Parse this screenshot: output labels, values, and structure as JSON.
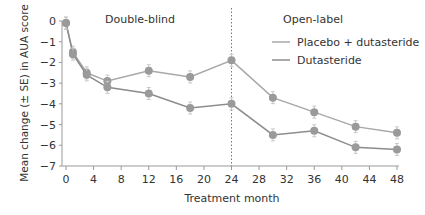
{
  "chart_data": {
    "type": "line",
    "title": "",
    "xlabel": "Treatment month",
    "ylabel": "Mean change (± SE) in AUA score",
    "xlim": [
      0,
      48
    ],
    "ylim": [
      -7,
      0
    ],
    "xticks": [
      0,
      4,
      8,
      12,
      16,
      20,
      24,
      28,
      32,
      36,
      40,
      44,
      48
    ],
    "yticks": [
      0,
      -1,
      -2,
      -3,
      -4,
      -5,
      -6,
      -7
    ],
    "grid": false,
    "legend_position": "upper right",
    "annotations": [
      {
        "text": "Double-blind",
        "x": 12
      },
      {
        "text": "Open-label",
        "x": 36
      },
      {
        "type": "vline",
        "x": 24,
        "style": "dotted"
      }
    ],
    "series": [
      {
        "name": "Placebo + dutasteride",
        "x": [
          0,
          1,
          3,
          6,
          12,
          18,
          24,
          30,
          36,
          42,
          48
        ],
        "values": [
          -0.1,
          -1.5,
          -2.5,
          -2.9,
          -2.4,
          -2.7,
          -1.9,
          -3.7,
          -4.4,
          -5.1,
          -5.4
        ],
        "color": "#a8a8a8"
      },
      {
        "name": "Dutasteride",
        "x": [
          0,
          1,
          3,
          6,
          12,
          18,
          24,
          30,
          36,
          42,
          48
        ],
        "values": [
          -0.1,
          -1.6,
          -2.6,
          -3.2,
          -3.5,
          -4.2,
          -4.0,
          -5.5,
          -5.3,
          -6.1,
          -6.2
        ],
        "color": "#8c8c8c"
      }
    ]
  },
  "labels": {
    "region_left": "Double-blind",
    "region_right": "Open-label",
    "legend_1": "Placebo + dutasteride",
    "legend_2": "Dutasteride",
    "xlabel": "Treatment month",
    "ylabel": "Mean change (± SE) in AUA score"
  }
}
